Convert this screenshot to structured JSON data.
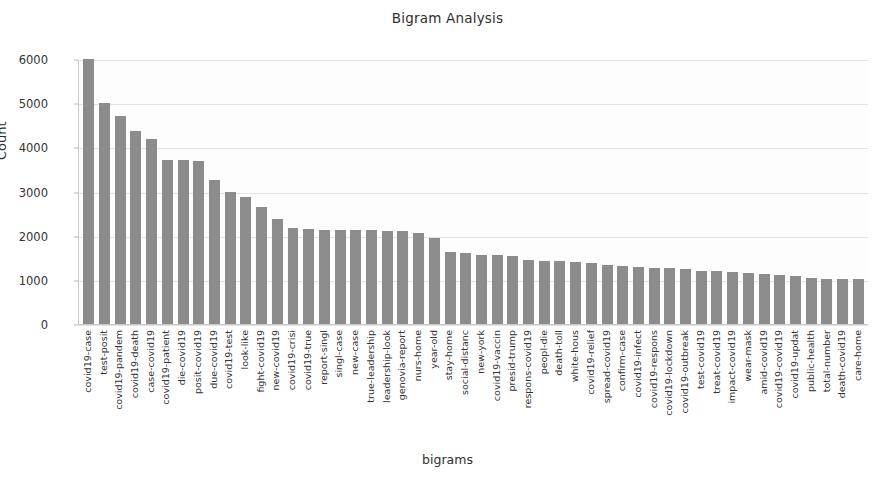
{
  "chart_data": {
    "type": "bar",
    "title": "Bigram Analysis",
    "xlabel": "bigrams",
    "ylabel": "Count",
    "ylim": [
      0,
      6000
    ],
    "yticks": [
      0,
      1000,
      2000,
      3000,
      4000,
      5000,
      6000
    ],
    "grid": true,
    "legend": null,
    "bar_color": "#8c8c8c",
    "background_color": "#ffffff",
    "categories": [
      "covid19-case",
      "test-posit",
      "covid19-pandem",
      "covid19-death",
      "case-covid19",
      "covid19-patient",
      "die-covid19",
      "posit-covid19",
      "due-covid19",
      "covid19-test",
      "look-like",
      "fight-covid19",
      "new-covid19",
      "covid19-crisi",
      "covid19-true",
      "report-singl",
      "singl-case",
      "new-case",
      "true-leadership",
      "leadership-look",
      "genovia-report",
      "nurs-home",
      "year-old",
      "stay-home",
      "social-distanc",
      "new-york",
      "covid19-vaccin",
      "presid-trump",
      "respons-covid19",
      "peopl-die",
      "death-toll",
      "white-hous",
      "covid19-relief",
      "spread-covid19",
      "confirm-case",
      "covid19-infect",
      "covid19-respons",
      "covid19-lockdown",
      "covid19-outbreak",
      "test-covid19",
      "treat-covid19",
      "impact-covid19",
      "wear-mask",
      "amid-covid19",
      "covid19-covid19",
      "covid19-updat",
      "public-health",
      "total-number",
      "death-covid19",
      "care-home"
    ],
    "values": [
      6050,
      5000,
      4700,
      4380,
      4200,
      3720,
      3720,
      3700,
      3250,
      3000,
      2880,
      2640,
      2380,
      2180,
      2150,
      2130,
      2130,
      2130,
      2120,
      2110,
      2100,
      2060,
      1940,
      1620,
      1600,
      1570,
      1560,
      1540,
      1440,
      1420,
      1420,
      1400,
      1390,
      1330,
      1310,
      1300,
      1270,
      1260,
      1250,
      1210,
      1190,
      1170,
      1150,
      1130,
      1110,
      1080,
      1040,
      1030,
      1020,
      1020
    ]
  }
}
